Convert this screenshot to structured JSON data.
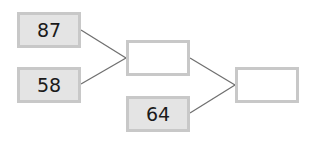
{
  "diagram": {
    "type": "addition-tree",
    "inputs": [
      {
        "id": "a",
        "value": "87"
      },
      {
        "id": "b",
        "value": "58"
      },
      {
        "id": "c",
        "value": "64"
      }
    ],
    "results": [
      {
        "id": "sum1",
        "value": "",
        "from": [
          "a",
          "b"
        ]
      },
      {
        "id": "sum2",
        "value": "",
        "from": [
          "sum1",
          "c"
        ]
      }
    ],
    "colors": {
      "box_border": "#c8c8c8",
      "filled_box_bg": "#e4e4e4",
      "empty_box_bg": "#ffffff",
      "line": "#707070"
    }
  }
}
